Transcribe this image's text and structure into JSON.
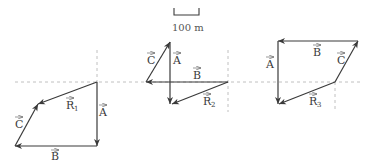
{
  "scale_bar": {
    "label": "100 m"
  },
  "diagrams": [
    {
      "id": "1",
      "labels": {
        "A": "A",
        "B": "B",
        "C": "C",
        "R": "R",
        "R_sub": "1"
      }
    },
    {
      "id": "2",
      "labels": {
        "A": "A",
        "B": "B",
        "C": "C",
        "R": "R",
        "R_sub": "2"
      }
    },
    {
      "id": "3",
      "labels": {
        "A": "A",
        "B": "B",
        "C": "C",
        "R": "R",
        "R_sub": "3"
      }
    }
  ],
  "colors": {
    "vector": "#3a3a3a",
    "guide": "#b0b0b0"
  }
}
